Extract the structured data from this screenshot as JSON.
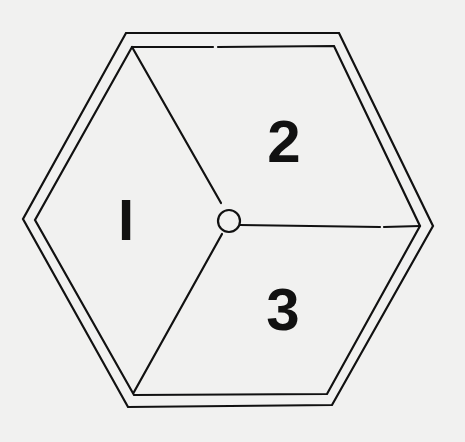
{
  "diagram": {
    "type": "hexagon-divided-into-three-regions",
    "colors": {
      "background": "#f1f1f0",
      "stroke": "#111111",
      "text": "#111111"
    },
    "outer_hexagon": [
      [
        126,
        33
      ],
      [
        339,
        33
      ],
      [
        433,
        226
      ],
      [
        332,
        405
      ],
      [
        128,
        407
      ],
      [
        23,
        219
      ]
    ],
    "inner_hexagon": [
      [
        132,
        47
      ],
      [
        334,
        46
      ],
      [
        420,
        226
      ],
      [
        327,
        394
      ],
      [
        134,
        395
      ],
      [
        35,
        220
      ]
    ],
    "center": {
      "x": 229,
      "y": 220,
      "r": 10
    },
    "spokes": [
      {
        "from": "center",
        "to": [
          132,
          47
        ]
      },
      {
        "from": "center",
        "to": [
          420,
          226
        ]
      },
      {
        "from": "center",
        "to": [
          134,
          395
        ]
      }
    ],
    "regions": [
      {
        "id": "region-1",
        "label": "I"
      },
      {
        "id": "region-2",
        "label": "2"
      },
      {
        "id": "region-3",
        "label": "3"
      }
    ]
  }
}
